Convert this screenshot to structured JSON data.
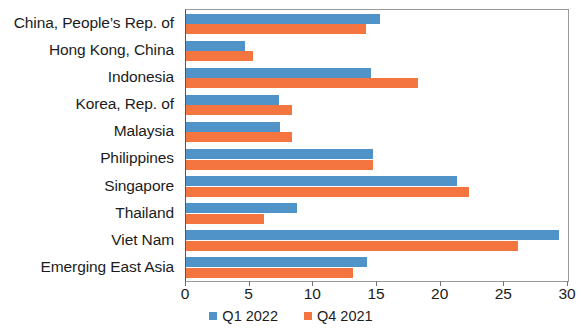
{
  "chart_data": {
    "type": "bar",
    "orientation": "horizontal",
    "title": "",
    "subtitle": "",
    "xlabel": "",
    "ylabel": "",
    "xlim": [
      0,
      30
    ],
    "xticks": [
      0,
      5,
      10,
      15,
      20,
      25,
      30
    ],
    "xtick_labels": [
      "0",
      "5",
      "10",
      "15",
      "20",
      "25",
      "30"
    ],
    "grid": false,
    "legend_position": "bottom",
    "categories": [
      "China, People’s Rep. of",
      "Hong Kong, China",
      "Indonesia",
      "Korea, Rep. of",
      "Malaysia",
      "Philippines",
      "Singapore",
      "Thailand",
      "Viet Nam",
      "Emerging East Asia"
    ],
    "series": [
      {
        "name": "Q1 2022",
        "color": "#4f93c8",
        "values": [
          15.2,
          4.6,
          14.5,
          7.3,
          7.4,
          14.7,
          21.3,
          8.7,
          29.3,
          14.2
        ]
      },
      {
        "name": "Q4 2021",
        "color": "#f4753f",
        "values": [
          14.1,
          5.3,
          18.2,
          8.3,
          8.3,
          14.7,
          22.2,
          6.1,
          26.1,
          13.1
        ]
      }
    ]
  },
  "legend": {
    "items": [
      {
        "label": "Q1 2022",
        "color": "#4f93c8"
      },
      {
        "label": "Q4 2021",
        "color": "#f4753f"
      }
    ]
  }
}
